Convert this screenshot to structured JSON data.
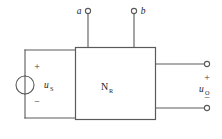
{
  "figure": {
    "type": "circuit-schematic",
    "colors": {
      "background": "#ffffff",
      "wire": "#5a5a5a",
      "text": "#1d1d1d"
    }
  },
  "terminals": {
    "top_left": {
      "label": "a"
    },
    "top_right": {
      "label": "b"
    },
    "output_top": {
      "label": ""
    },
    "output_bottom": {
      "label": ""
    }
  },
  "source": {
    "symbol": "voltage-source-circle",
    "label_main": "u",
    "label_sub": "S",
    "plus_sign": "+",
    "minus_sign": "−"
  },
  "network_box": {
    "label_main": "N",
    "label_sub": "R"
  },
  "output": {
    "label_main": "u",
    "label_sub": "O",
    "plus_sign": "+",
    "minus_sign": "−"
  }
}
